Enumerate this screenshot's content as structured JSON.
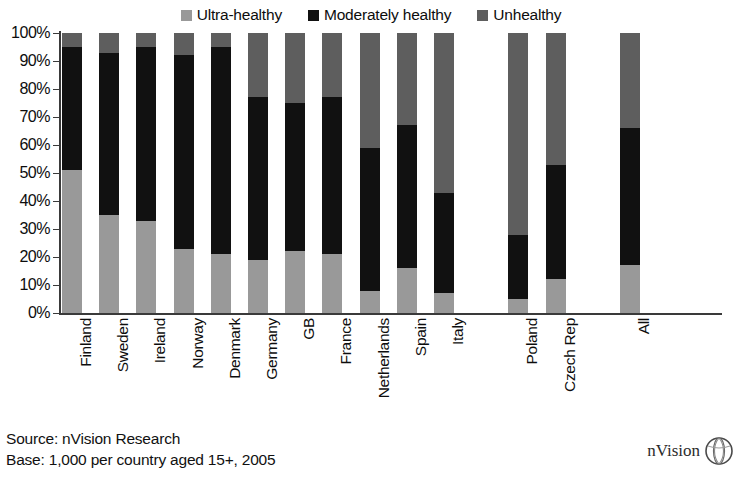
{
  "legend": {
    "items": [
      {
        "label": "Ultra-healthy",
        "color": "#999999",
        "icon": "square-swatch-icon"
      },
      {
        "label": "Moderately healthy",
        "color": "#111111",
        "icon": "square-swatch-icon"
      },
      {
        "label": "Unhealthy",
        "color": "#5e5e5e",
        "icon": "square-swatch-icon"
      }
    ]
  },
  "footer": {
    "source": "Source: nVision Research",
    "base": "Base: 1,000 per country aged 15+, 2005"
  },
  "brand": {
    "name": "nVision",
    "mark": "globe-logo-icon"
  },
  "chart_data": {
    "type": "bar",
    "stacked": true,
    "title": "",
    "xlabel": "",
    "ylabel": "",
    "ylim": [
      0,
      100
    ],
    "grid": false,
    "legend_position": "top-center",
    "y_ticks": [
      "0%",
      "10%",
      "20%",
      "30%",
      "40%",
      "50%",
      "60%",
      "70%",
      "80%",
      "90%",
      "100%"
    ],
    "y_tick_values": [
      0,
      10,
      20,
      30,
      40,
      50,
      60,
      70,
      80,
      90,
      100
    ],
    "categories": [
      "Finland",
      "Sweden",
      "Ireland",
      "Norway",
      "Denmark",
      "Germany",
      "GB",
      "France",
      "Netherlands",
      "Spain",
      "Italy",
      "",
      "Poland",
      "Czech Rep",
      "",
      "All"
    ],
    "series": [
      {
        "name": "Ultra-healthy",
        "color": "#999999",
        "values": [
          51,
          35,
          33,
          23,
          21,
          19,
          22,
          21,
          8,
          16,
          7,
          null,
          5,
          12,
          null,
          17
        ]
      },
      {
        "name": "Moderately healthy",
        "color": "#111111",
        "values": [
          44,
          58,
          62,
          69,
          74,
          58,
          53,
          56,
          51,
          51,
          36,
          null,
          23,
          41,
          null,
          49
        ]
      },
      {
        "name": "Unhealthy",
        "color": "#5e5e5e",
        "values": [
          5,
          7,
          5,
          8,
          5,
          23,
          25,
          23,
          41,
          33,
          57,
          null,
          72,
          47,
          null,
          34
        ]
      }
    ],
    "stack_tops": {
      "Finland": {
        "ultra_top": 51,
        "moderate_top": 95
      },
      "Sweden": {
        "ultra_top": 35,
        "moderate_top": 93
      },
      "Ireland": {
        "ultra_top": 33,
        "moderate_top": 95
      },
      "Norway": {
        "ultra_top": 23,
        "moderate_top": 92
      },
      "Denmark": {
        "ultra_top": 21,
        "moderate_top": 95
      },
      "Germany": {
        "ultra_top": 19,
        "moderate_top": 77
      },
      "GB": {
        "ultra_top": 22,
        "moderate_top": 75
      },
      "France": {
        "ultra_top": 21,
        "moderate_top": 77
      },
      "Netherlands": {
        "ultra_top": 8,
        "moderate_top": 59
      },
      "Spain": {
        "ultra_top": 16,
        "moderate_top": 67
      },
      "Italy": {
        "ultra_top": 7,
        "moderate_top": 43
      },
      "Poland": {
        "ultra_top": 5,
        "moderate_top": 28
      },
      "Czech Rep": {
        "ultra_top": 12,
        "moderate_top": 53
      },
      "All": {
        "ultra_top": 17,
        "moderate_top": 66
      }
    }
  }
}
